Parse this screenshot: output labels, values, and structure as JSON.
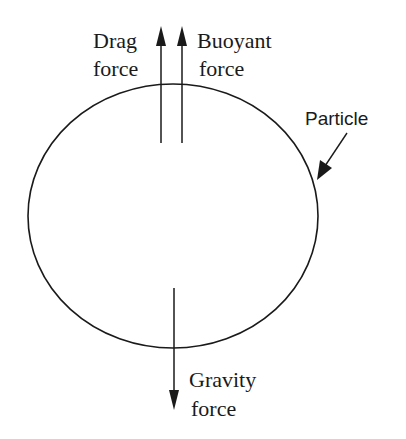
{
  "diagram": {
    "title": "",
    "nodes": [
      {
        "id": "particle",
        "shape": "ellipse",
        "label": "Particle"
      }
    ],
    "forces": [
      {
        "id": "drag",
        "label_line1": "Drag",
        "label_line2": "force",
        "direction": "up"
      },
      {
        "id": "buoyant",
        "label_line1": "Buoyant",
        "label_line2": "force",
        "direction": "up"
      },
      {
        "id": "gravity",
        "label_line1": "Gravity",
        "label_line2": "force",
        "direction": "down"
      }
    ],
    "particle_label": "Particle",
    "colors": {
      "stroke": "#1a1a1a",
      "background": "#ffffff"
    }
  }
}
